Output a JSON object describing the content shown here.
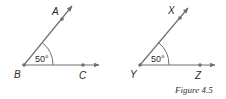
{
  "figures": [
    {
      "id": "left",
      "vertex_label": "B",
      "ray1_label": "A",
      "ray2_label": "C",
      "angle_label": "50°",
      "vertex": [
        24,
        65
      ],
      "ray1_end": [
        72,
        6
      ],
      "ray1_dot": [
        62,
        19
      ],
      "ray2_end": [
        99,
        65
      ],
      "ray2_dot": [
        83,
        65
      ]
    },
    {
      "id": "right",
      "vertex_label": "Y",
      "ray1_label": "X",
      "ray2_label": "Z",
      "angle_label": "50°",
      "vertex": [
        140,
        65
      ],
      "ray1_end": [
        188,
        8
      ],
      "ray1_dot": [
        180,
        18
      ],
      "ray2_end": [
        215,
        65
      ],
      "ray2_dot": [
        200,
        65
      ]
    }
  ],
  "caption": "Figure 4.5",
  "colors": {
    "line": "#707070",
    "text": "#2a2a2a"
  }
}
